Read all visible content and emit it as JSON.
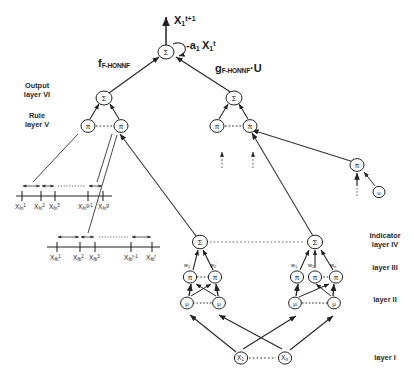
{
  "diagram": {
    "output_expression": "X",
    "output_sub": "1",
    "output_sup": "t+1",
    "feedback_expression": "-a",
    "feedback_sub1": "1",
    "feedback_var": "X",
    "feedback_sub2": "1",
    "feedback_sup": "t",
    "function_left": "f",
    "function_left_sub": "F-HONNF",
    "function_right": "g",
    "function_right_sub": "F-HONNF",
    "function_right_tail": "·U",
    "sigma_glyph": "Σ",
    "pi_glyph": "π",
    "mu_glyph": "μ",
    "node_x_glyph": "X",
    "node_u_glyph": "u"
  },
  "layer_labels_left": [
    {
      "line1": "Output",
      "line2": "layer VI"
    },
    {
      "line1": "Rule",
      "line2": "layer V"
    }
  ],
  "layer_labels_right": [
    {
      "line1": "Indicator",
      "line2": "layer IV"
    },
    {
      "line1": "layer III",
      "line2": ""
    },
    {
      "line1": "layer II",
      "line2": ""
    },
    {
      "line1": "layer I",
      "line2": ""
    }
  ],
  "axis_fn": {
    "name": "membership-axis-fn",
    "ticks": [
      {
        "base": "X",
        "sub": "fn",
        "sup": "1"
      },
      {
        "base": "X",
        "sub": "fn",
        "sup": "2"
      },
      {
        "base": "X",
        "sub": "fn",
        "sup": "3"
      },
      {
        "base": "X",
        "sub": "fn",
        "sup": "g-1"
      },
      {
        "base": "X",
        "sub": "fn",
        "sup": "g"
      }
    ]
  },
  "axis_fb": {
    "name": "membership-axis-fb",
    "ticks": [
      {
        "base": "X",
        "sub": "fb",
        "sup": "1"
      },
      {
        "base": "X",
        "sub": "fb",
        "sup": "2"
      },
      {
        "base": "X",
        "sub": "fb",
        "sup": "3"
      },
      {
        "base": "X",
        "sub": "fb",
        "sup": "r-1"
      },
      {
        "base": "X",
        "sub": "fb",
        "sup": "r"
      }
    ]
  },
  "weights_left": [
    {
      "base": "w",
      "sub": "1",
      "sup": "'"
    },
    {
      "base": "w",
      "sub": "2",
      "sup": "'"
    },
    {
      "base": "w",
      "sub": "n",
      "sup": "'"
    }
  ],
  "weights_right": [
    {
      "base": "w",
      "sub": "1",
      "sup": "'"
    },
    {
      "base": "w",
      "sub": "2",
      "sup": "'"
    },
    {
      "base": "w",
      "sub": "n",
      "sup": "'"
    }
  ],
  "input_nodes": [
    {
      "base": "X",
      "sub": "1"
    },
    {
      "base": "X",
      "sub": "n"
    }
  ]
}
